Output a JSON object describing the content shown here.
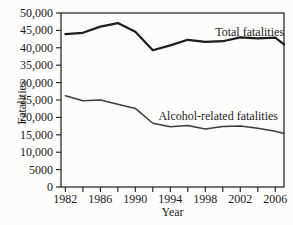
{
  "chart_data": {
    "type": "line",
    "title": "",
    "xlabel": "Year",
    "ylabel": "Fatalities",
    "xlim": [
      1981.5,
      2007
    ],
    "ylim": [
      0,
      50000
    ],
    "grid": false,
    "legend_position": "inline-annotations",
    "background_color": "#fcfcfa",
    "axis_color": "#1c1c1c",
    "x_ticks": [
      {
        "year": 1982,
        "label": "1982"
      },
      {
        "year": 1984,
        "label": ""
      },
      {
        "year": 1986,
        "label": "1986"
      },
      {
        "year": 1988,
        "label": ""
      },
      {
        "year": 1990,
        "label": "1990"
      },
      {
        "year": 1992,
        "label": ""
      },
      {
        "year": 1994,
        "label": "1994"
      },
      {
        "year": 1996,
        "label": ""
      },
      {
        "year": 1998,
        "label": "1998"
      },
      {
        "year": 2000,
        "label": ""
      },
      {
        "year": 2002,
        "label": "2002"
      },
      {
        "year": 2004,
        "label": ""
      },
      {
        "year": 2006,
        "label": "2006"
      }
    ],
    "y_ticks": [
      {
        "value": 0,
        "label": "0"
      },
      {
        "value": 5000,
        "label": "5000"
      },
      {
        "value": 10000,
        "label": "10,000"
      },
      {
        "value": 15000,
        "label": "15,000"
      },
      {
        "value": 20000,
        "label": "20,000"
      },
      {
        "value": 25000,
        "label": "25,000"
      },
      {
        "value": 30000,
        "label": "30,000"
      },
      {
        "value": 35000,
        "label": "35,000"
      },
      {
        "value": 40000,
        "label": "40,000"
      },
      {
        "value": 45000,
        "label": "45,000"
      },
      {
        "value": 50000,
        "label": "50,000"
      }
    ],
    "series": [
      {
        "name": "Total fatalities",
        "color": "#1c1c1c",
        "stroke_width": 2.2,
        "x": [
          1982,
          1984,
          1986,
          1988,
          1990,
          1992,
          1994,
          1996,
          1998,
          2000,
          2002,
          2004,
          2006,
          2007
        ],
        "values": [
          43900,
          44300,
          46100,
          47100,
          44600,
          39300,
          40700,
          42300,
          41700,
          41900,
          43000,
          42700,
          42900,
          41000
        ]
      },
      {
        "name": "Alcohol-related fatalities",
        "color": "#3c3c3c",
        "stroke_width": 1.5,
        "x": [
          1982,
          1984,
          1986,
          1988,
          1990,
          1992,
          1994,
          1996,
          1998,
          2000,
          2002,
          2004,
          2006,
          2007
        ],
        "values": [
          26200,
          24800,
          25000,
          23800,
          22600,
          18300,
          17300,
          17700,
          16700,
          17400,
          17500,
          16900,
          16000,
          15400
        ]
      }
    ]
  }
}
